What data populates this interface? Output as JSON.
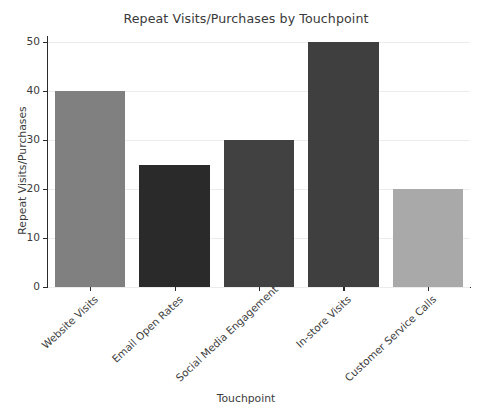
{
  "chart_data": {
    "type": "bar",
    "title": "Repeat Visits/Purchases by Touchpoint",
    "xlabel": "Touchpoint",
    "ylabel": "Repeat Visits/Purchases",
    "categories": [
      "Website Visits",
      "Email Open Rates",
      "Social Media Engagement",
      "In-store Visits",
      "Customer Service Calls"
    ],
    "values": [
      40,
      25,
      30,
      50,
      20
    ],
    "bar_colors": [
      "#808080",
      "#2a2a2a",
      "#414141",
      "#3f3f3f",
      "#a9a9a9"
    ],
    "ylim": [
      0,
      50
    ],
    "yticks": [
      0,
      10,
      20,
      30,
      40,
      50
    ],
    "ytick_labels": [
      "0",
      "10",
      "20",
      "30",
      "40",
      "50"
    ],
    "grid": true,
    "grid_axis": "y",
    "grid_color": "#ececec",
    "legend": false,
    "background_color": "#ffffff",
    "text_color": "#3c3c3c",
    "tick_label_rotation": -43
  }
}
